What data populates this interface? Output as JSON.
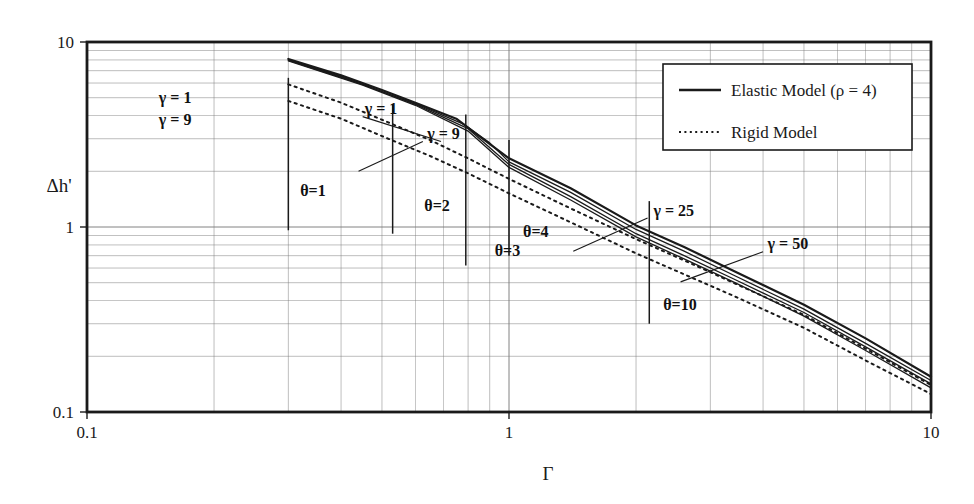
{
  "chart_data": {
    "type": "line",
    "title": "",
    "xlabel": "Γ",
    "ylabel": "Δh'",
    "xscale": "log",
    "yscale": "log",
    "xlim": [
      0.1,
      10
    ],
    "ylim": [
      0.1,
      10
    ],
    "xticks": [
      "0.1",
      "1",
      "10"
    ],
    "yticks": [
      "0.1",
      "1",
      "10"
    ],
    "grid": "minor-log-both-axes",
    "legend": {
      "position": "top-right-inside",
      "entries": [
        {
          "label": "Elastic Model (ρ = 4)",
          "style": "solid"
        },
        {
          "label": "Rigid Model",
          "style": "dotted"
        }
      ]
    },
    "series": [
      {
        "name": "Elastic Model γ = 1",
        "style": "solid",
        "width": 2.2,
        "points": [
          [
            0.3,
            8.1
          ],
          [
            0.4,
            6.6
          ],
          [
            0.5,
            5.5
          ],
          [
            0.6,
            4.7
          ],
          [
            0.75,
            3.85
          ],
          [
            0.85,
            3.1
          ],
          [
            1.0,
            2.35
          ],
          [
            1.4,
            1.62
          ],
          [
            2.0,
            1.02
          ],
          [
            2.6,
            0.78
          ],
          [
            3.4,
            0.58
          ],
          [
            5.0,
            0.38
          ],
          [
            7.0,
            0.25
          ],
          [
            10.0,
            0.155
          ]
        ]
      },
      {
        "name": "Elastic Model γ = 9",
        "style": "solid",
        "width": 1.3,
        "points": [
          [
            0.3,
            8.0
          ],
          [
            0.4,
            6.5
          ],
          [
            0.5,
            5.4
          ],
          [
            0.62,
            4.5
          ],
          [
            0.78,
            3.6
          ],
          [
            0.9,
            2.85
          ],
          [
            1.0,
            2.25
          ],
          [
            1.4,
            1.54
          ],
          [
            2.0,
            0.97
          ],
          [
            2.6,
            0.74
          ],
          [
            3.4,
            0.55
          ],
          [
            5.0,
            0.36
          ],
          [
            7.0,
            0.235
          ],
          [
            10.0,
            0.148
          ]
        ]
      },
      {
        "name": "Elastic Model γ = 25",
        "style": "solid",
        "width": 1.3,
        "points": [
          [
            0.3,
            7.95
          ],
          [
            0.45,
            5.9
          ],
          [
            0.6,
            4.6
          ],
          [
            0.8,
            3.4
          ],
          [
            1.0,
            2.18
          ],
          [
            1.4,
            1.46
          ],
          [
            2.0,
            0.92
          ],
          [
            2.6,
            0.7
          ],
          [
            3.4,
            0.525
          ],
          [
            5.0,
            0.345
          ],
          [
            7.0,
            0.225
          ],
          [
            10.0,
            0.142
          ]
        ]
      },
      {
        "name": "Elastic Model γ = 50",
        "style": "solid",
        "width": 1.3,
        "points": [
          [
            0.3,
            7.9
          ],
          [
            0.45,
            5.85
          ],
          [
            0.6,
            4.55
          ],
          [
            0.8,
            3.3
          ],
          [
            1.0,
            2.1
          ],
          [
            1.4,
            1.4
          ],
          [
            2.0,
            0.885
          ],
          [
            2.6,
            0.672
          ],
          [
            3.4,
            0.505
          ],
          [
            5.0,
            0.33
          ],
          [
            7.0,
            0.215
          ],
          [
            10.0,
            0.135
          ]
        ]
      },
      {
        "name": "Rigid Model γ = 1",
        "style": "dotted",
        "width": 2.0,
        "points": [
          [
            0.3,
            5.9
          ],
          [
            0.4,
            4.7
          ],
          [
            0.5,
            3.8
          ],
          [
            0.65,
            2.95
          ],
          [
            0.8,
            2.35
          ],
          [
            1.0,
            1.82
          ],
          [
            1.4,
            1.26
          ],
          [
            2.0,
            0.86
          ],
          [
            2.6,
            0.66
          ],
          [
            3.4,
            0.5
          ],
          [
            5.0,
            0.335
          ],
          [
            7.0,
            0.22
          ],
          [
            10.0,
            0.14
          ]
        ]
      },
      {
        "name": "Rigid Model γ = 9",
        "style": "dotted",
        "width": 2.0,
        "points": [
          [
            0.3,
            4.8
          ],
          [
            0.4,
            3.85
          ],
          [
            0.5,
            3.1
          ],
          [
            0.65,
            2.42
          ],
          [
            0.8,
            1.95
          ],
          [
            1.0,
            1.52
          ],
          [
            1.4,
            1.06
          ],
          [
            2.0,
            0.72
          ],
          [
            2.6,
            0.555
          ],
          [
            3.4,
            0.425
          ],
          [
            5.0,
            0.285
          ],
          [
            7.0,
            0.19
          ],
          [
            10.0,
            0.125
          ]
        ]
      }
    ],
    "annotations": [
      {
        "id": "gamma-1-left",
        "text": "γ = 1",
        "x": 0.148,
        "y": 4.7,
        "anchor": "start"
      },
      {
        "id": "gamma-9-left",
        "text": "γ = 9",
        "x": 0.148,
        "y": 3.55,
        "anchor": "start"
      },
      {
        "id": "gamma-1-mid",
        "text": "γ = 1",
        "x": 0.455,
        "y": 4.1,
        "anchor": "start"
      },
      {
        "id": "gamma-9-mid",
        "text": "γ = 9",
        "x": 0.64,
        "y": 3.0,
        "anchor": "start"
      },
      {
        "id": "gamma-25",
        "text": "γ = 25",
        "x": 2.2,
        "y": 1.15,
        "anchor": "start"
      },
      {
        "id": "gamma-50",
        "text": "γ = 50",
        "x": 4.1,
        "y": 0.76,
        "anchor": "start"
      },
      {
        "id": "theta-1",
        "text": "θ=1",
        "x": 0.32,
        "y": 1.48,
        "anchor": "start"
      },
      {
        "id": "theta-2",
        "text": "θ=2",
        "x": 0.63,
        "y": 1.22,
        "anchor": "start"
      },
      {
        "id": "theta-3",
        "text": "θ=3",
        "x": 0.925,
        "y": 0.695,
        "anchor": "start"
      },
      {
        "id": "theta-4",
        "text": "θ=4",
        "x": 1.08,
        "y": 0.885,
        "anchor": "start"
      },
      {
        "id": "theta-10",
        "text": "θ=10",
        "x": 2.32,
        "y": 0.355,
        "anchor": "start"
      }
    ],
    "theta_markers": [
      {
        "id": "theta-1-bar",
        "x": 0.3,
        "y0": 0.96,
        "y1": 6.4
      },
      {
        "id": "theta-2-bar",
        "x": 0.53,
        "y0": 0.92,
        "y1": 4.6
      },
      {
        "id": "theta-3-bar",
        "x": 0.79,
        "y0": 0.62,
        "y1": 4.05
      },
      {
        "id": "theta-4-bar",
        "x": 1.0,
        "y0": 0.7,
        "y1": 2.95
      },
      {
        "id": "theta-10-bar",
        "x": 2.15,
        "y0": 0.3,
        "y1": 1.38
      }
    ],
    "leaders": [
      {
        "id": "leader-gamma-1-mid",
        "x1": 0.45,
        "y1": 3.95,
        "x2": 0.69,
        "y2": 2.9
      },
      {
        "id": "leader-gamma-9-mid",
        "x1": 0.625,
        "y1": 2.9,
        "x2": 0.44,
        "y2": 2.0
      },
      {
        "id": "leader-gamma-25",
        "x1": 2.13,
        "y1": 1.12,
        "x2": 1.42,
        "y2": 0.74
      },
      {
        "id": "leader-gamma-50",
        "x1": 4.0,
        "y1": 0.735,
        "x2": 2.55,
        "y2": 0.505
      }
    ]
  }
}
